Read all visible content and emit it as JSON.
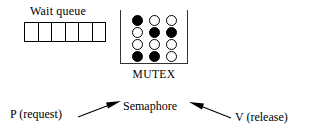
{
  "diagram": {
    "wait_queue": {
      "label": "Wait queue",
      "cell_count": 6,
      "cells": [
        "",
        "",
        "",
        "",
        "",
        ""
      ]
    },
    "mutex": {
      "label": "MUTEX",
      "grid": {
        "columns": 3,
        "rows": 4,
        "tokens": [
          [
            "filled",
            "empty",
            "empty"
          ],
          [
            "empty",
            "filled",
            "filled"
          ],
          [
            "empty",
            "empty",
            "empty"
          ],
          [
            "filled",
            "filled",
            "empty"
          ]
        ]
      }
    },
    "operations": {
      "p_label": "P (request)",
      "semaphore_label": "Semaphore",
      "v_label": "V (release)"
    },
    "colors": {
      "ink": "#000000",
      "box_stroke": "#333333",
      "background": "#ffffff"
    }
  }
}
